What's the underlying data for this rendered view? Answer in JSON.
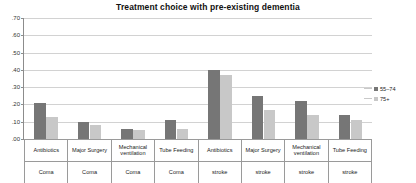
{
  "chart_data": {
    "type": "bar",
    "title": "Treatment choice with pre-existing dementia",
    "xlabel": "",
    "ylabel": "",
    "ylim": [
      0.0,
      0.7
    ],
    "ytick_labels": [
      ".70",
      ".60",
      ".50",
      ".40",
      ".30",
      ".20",
      ".10",
      ".00"
    ],
    "ytick_values": [
      0.7,
      0.6,
      0.5,
      0.4,
      0.3,
      0.2,
      0.1,
      0.0
    ],
    "grid": true,
    "legend_position": "right",
    "categories": [
      {
        "treatment": "Antibiotics",
        "condition": "Coma"
      },
      {
        "treatment": "Major Surgery",
        "condition": "Coma"
      },
      {
        "treatment": "Mechanical ventilation",
        "condition": "Coma"
      },
      {
        "treatment": "Tube Feeding",
        "condition": "Coma"
      },
      {
        "treatment": "Antibiotics",
        "condition": "stroke"
      },
      {
        "treatment": "Major Surgery",
        "condition": "stroke"
      },
      {
        "treatment": "Mechanical ventilation",
        "condition": "stroke"
      },
      {
        "treatment": "Tube Feeding",
        "condition": "stroke"
      }
    ],
    "series": [
      {
        "name": "55–74",
        "color": "#767676",
        "values": [
          0.21,
          0.1,
          0.06,
          0.11,
          0.4,
          0.25,
          0.22,
          0.14
        ]
      },
      {
        "name": "75+",
        "color": "#c8c8c8",
        "values": [
          0.13,
          0.08,
          0.05,
          0.06,
          0.37,
          0.17,
          0.14,
          0.11
        ]
      }
    ]
  },
  "legend": {
    "entries": [
      {
        "label": "55–74"
      },
      {
        "label": "75+"
      }
    ]
  }
}
